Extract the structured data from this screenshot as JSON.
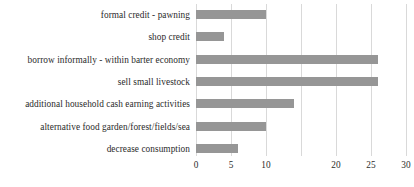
{
  "chart_data": {
    "type": "bar",
    "orientation": "horizontal",
    "title": "",
    "subtitle": "",
    "xlabel": "",
    "ylabel": "",
    "xlim": [
      0,
      30
    ],
    "grid": "vertical",
    "legend": "none",
    "bar_color": "#969696",
    "gridline_color": "#d9d9d9",
    "text_color": "#2b2b2b",
    "xticks": [
      0,
      5,
      10,
      15,
      20,
      25,
      30
    ],
    "xtick_labels": [
      "0",
      "5",
      "10",
      "",
      "20",
      "25",
      "30"
    ],
    "categories": [
      "formal credit - pawning",
      "shop credit",
      "borrow informally - within barter economy",
      "sell small livestock",
      "additional household cash earning activities",
      "alternative food garden/forest/fields/sea",
      "decrease consumption"
    ],
    "values": [
      10,
      4,
      26,
      26,
      14,
      10,
      6
    ]
  }
}
